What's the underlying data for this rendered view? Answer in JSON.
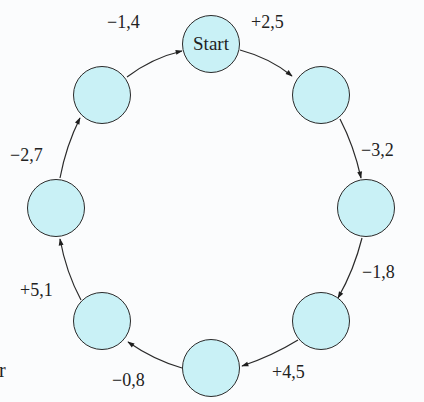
{
  "diagram": {
    "type": "cycle",
    "fill_color": "#c9f1f6",
    "stroke_color": "#2a2a2a",
    "nodes": [
      {
        "id": "n0",
        "label": "Start",
        "cx": 211,
        "cy": 44
      },
      {
        "id": "n1",
        "label": "",
        "cx": 321,
        "cy": 95
      },
      {
        "id": "n2",
        "label": "",
        "cx": 366,
        "cy": 208
      },
      {
        "id": "n3",
        "label": "",
        "cx": 321,
        "cy": 321
      },
      {
        "id": "n4",
        "label": "",
        "cx": 211,
        "cy": 368
      },
      {
        "id": "n5",
        "label": "",
        "cx": 102,
        "cy": 321
      },
      {
        "id": "n6",
        "label": "",
        "cx": 56,
        "cy": 208
      },
      {
        "id": "n7",
        "label": "",
        "cx": 102,
        "cy": 95
      }
    ],
    "edges": [
      {
        "from": "n0",
        "to": "n1",
        "label": "+2,5"
      },
      {
        "from": "n1",
        "to": "n2",
        "label": "−3,2"
      },
      {
        "from": "n2",
        "to": "n3",
        "label": "−1,8"
      },
      {
        "from": "n3",
        "to": "n4",
        "label": "+4,5"
      },
      {
        "from": "n4",
        "to": "n5",
        "label": "−0,8"
      },
      {
        "from": "n5",
        "to": "n6",
        "label": "+5,1"
      },
      {
        "from": "n6",
        "to": "n7",
        "label": "−2,7"
      },
      {
        "from": "n7",
        "to": "n0",
        "label": "−1,4"
      }
    ]
  },
  "cutoff_text": "r"
}
